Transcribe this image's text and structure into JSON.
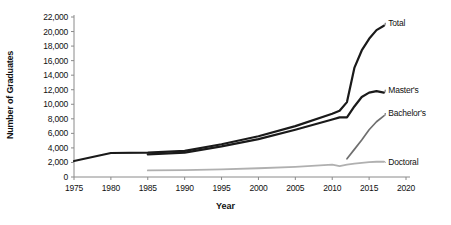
{
  "chart_data": {
    "type": "line",
    "title": "",
    "xlabel": "Year",
    "ylabel": "Number of Graduates",
    "xlim": [
      1975,
      2020
    ],
    "ylim": [
      0,
      22000
    ],
    "grid": false,
    "legend_position": "right-inline-labels",
    "xticks": [
      "1975",
      "1980",
      "1985",
      "1990",
      "1995",
      "2000",
      "2005",
      "2010",
      "2015",
      "2020"
    ],
    "xtick_values": [
      1975,
      1980,
      1985,
      1990,
      1995,
      2000,
      2005,
      2010,
      2015,
      2020
    ],
    "yticks": [
      "0",
      "2,000",
      "4,000",
      "6,000",
      "8,000",
      "10,000",
      "12,000",
      "14,000",
      "16,000",
      "18,000",
      "20,000",
      "22,000"
    ],
    "ytick_values": [
      0,
      2000,
      4000,
      6000,
      8000,
      10000,
      12000,
      14000,
      16000,
      18000,
      20000,
      22000
    ],
    "series": [
      {
        "name": "Total",
        "color": "#1a1a1a",
        "width": 2.2,
        "label": "Total",
        "label_x": 2017.6,
        "label_y": 21200,
        "x": [
          1975,
          1980,
          1985,
          1990,
          1995,
          2000,
          2005,
          2010,
          2011,
          2012,
          2013,
          2014,
          2015,
          2016,
          2017
        ],
        "y": [
          2200,
          3300,
          3350,
          3600,
          4500,
          5600,
          7000,
          8700,
          9100,
          10300,
          15000,
          17400,
          19000,
          20200,
          20800
        ]
      },
      {
        "name": "Master's",
        "color": "#1a1a1a",
        "width": 2.2,
        "label": "Master's",
        "label_x": 2017.6,
        "label_y": 12000,
        "x": [
          1985,
          1990,
          1995,
          2000,
          2005,
          2010,
          2011,
          2012,
          2013,
          2014,
          2015,
          2016,
          2017
        ],
        "y": [
          3100,
          3350,
          4200,
          5200,
          6500,
          7900,
          8200,
          8200,
          9700,
          11000,
          11600,
          11800,
          11600
        ]
      },
      {
        "name": "Bachelor's",
        "color": "#6f6f6f",
        "width": 1.7,
        "label": "Bachelor's",
        "label_x": 2017.6,
        "label_y": 8800,
        "x": [
          2012,
          2013,
          2014,
          2015,
          2016,
          2017
        ],
        "y": [
          2500,
          3800,
          5100,
          6500,
          7600,
          8400
        ]
      },
      {
        "name": "Doctoral",
        "color": "#b0b0b0",
        "width": 1.8,
        "label": "Doctoral",
        "label_x": 2017.6,
        "label_y": 2000,
        "x": [
          1985,
          1990,
          1995,
          2000,
          2005,
          2010,
          2011,
          2012,
          2013,
          2014,
          2015,
          2016,
          2017
        ],
        "y": [
          900,
          950,
          1050,
          1200,
          1400,
          1700,
          1500,
          1700,
          1850,
          1950,
          2050,
          2100,
          2100
        ]
      }
    ]
  }
}
